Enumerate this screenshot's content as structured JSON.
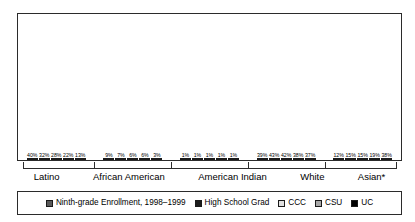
{
  "chart_data": {
    "type": "bar",
    "title": "",
    "subtitle": "",
    "xlabel": "",
    "ylabel": "",
    "ylim": [
      0,
      48
    ],
    "grid": false,
    "legend_position": "bottom",
    "categories": [
      "Latino",
      "African American",
      "American Indian",
      "White",
      "Asian*"
    ],
    "series": [
      {
        "name": "Ninth-grade Enrollment, 1998–1999",
        "color": "#595959",
        "values": [
          40,
          9,
          1,
          39,
          12
        ],
        "labels": [
          "40%",
          "9%",
          "1%",
          "39%",
          "12%"
        ]
      },
      {
        "name": "High School Grad",
        "color": "#1c1c1c",
        "values": [
          32,
          7,
          1,
          43,
          15
        ],
        "labels": [
          "32%",
          "7%",
          "1%",
          "43%",
          "15%"
        ]
      },
      {
        "name": "CCC",
        "color": "#e0e0e0",
        "values": [
          28,
          6,
          1,
          42,
          15
        ],
        "labels": [
          "28%",
          "6%",
          "1%",
          "42%",
          "15%"
        ]
      },
      {
        "name": "CSU",
        "color": "#a8a8a8",
        "values": [
          22,
          6,
          1,
          38,
          19
        ],
        "labels": [
          "22%",
          "6%",
          "1%",
          "38%",
          "19%"
        ]
      },
      {
        "name": "UC",
        "color": "#000000",
        "values": [
          13,
          3,
          1,
          37,
          38
        ],
        "labels": [
          "13%",
          "3%",
          "1%",
          "37%",
          "38%"
        ]
      }
    ]
  },
  "legend": {
    "items": [
      {
        "label": "Ninth-grade Enrollment, 1998–1999",
        "color": "#595959"
      },
      {
        "label": "High School Grad",
        "color": "#1c1c1c"
      },
      {
        "label": "CCC",
        "color": "#e0e0e0"
      },
      {
        "label": "CSU",
        "color": "#a8a8a8"
      },
      {
        "label": "UC",
        "color": "#000000"
      }
    ]
  },
  "axis": {
    "categories": [
      "Latino",
      "African American",
      "American Indian",
      "White",
      "Asian*"
    ]
  }
}
